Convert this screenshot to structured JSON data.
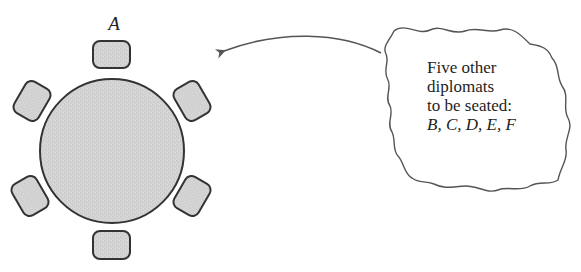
{
  "diagram": {
    "type": "seating-arrangement",
    "table": {
      "shape": "circle",
      "fill": "#d2d2d2",
      "stroke": "#333333"
    },
    "chairs": [
      {
        "position": "top",
        "label": "A"
      },
      {
        "position": "upper-right",
        "label": ""
      },
      {
        "position": "lower-right",
        "label": ""
      },
      {
        "position": "bottom",
        "label": ""
      },
      {
        "position": "lower-left",
        "label": ""
      },
      {
        "position": "upper-left",
        "label": ""
      }
    ],
    "seated_label": "A",
    "callout": {
      "shape": "cloud",
      "lines": [
        "Five  other",
        "diplomats",
        "to be seated:"
      ],
      "names_line": "B, C, D, E, F",
      "names": [
        "B",
        "C",
        "D",
        "E",
        "F"
      ]
    },
    "arrow": {
      "direction": "points-left-toward-table",
      "color": "#555555"
    },
    "colors": {
      "chair_fill": "#d0d0d0",
      "outline": "#333333",
      "text": "#1e1e1e",
      "cloud_stroke": "#555555"
    }
  }
}
